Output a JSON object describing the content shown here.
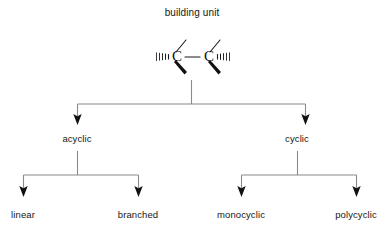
{
  "diagram": {
    "type": "hierarchy-tree",
    "title": "building unit",
    "structure": {
      "name": "carbon-carbon-building-unit",
      "atom_left": "C",
      "atom_right": "C",
      "bond_center": "single",
      "bonds_per_atom": [
        "plain-line-up",
        "bold-wedge-down",
        "hashed-wedge-outward",
        "single-bond-center"
      ]
    },
    "levels": [
      {
        "name": "level-1",
        "nodes": [
          {
            "id": "acyclic",
            "label": "acyclic"
          },
          {
            "id": "cyclic",
            "label": "cyclic"
          }
        ]
      },
      {
        "name": "level-2",
        "nodes": [
          {
            "id": "linear",
            "label": "linear",
            "parent": "acyclic"
          },
          {
            "id": "branched",
            "label": "branched",
            "parent": "acyclic"
          },
          {
            "id": "monocyclic",
            "label": "monocyclic",
            "parent": "cyclic"
          },
          {
            "id": "polycyclic",
            "label": "polycyclic",
            "parent": "cyclic"
          }
        ]
      }
    ],
    "colors": {
      "background": "#ffffff",
      "text": "#161616",
      "connector": "#8a8a8a",
      "arrowhead": "#111111",
      "bond": "#1a1a1a"
    }
  }
}
